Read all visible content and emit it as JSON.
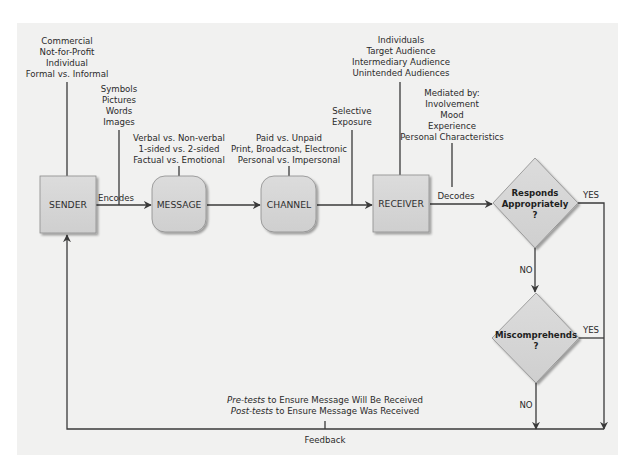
{
  "diagram": {
    "colors": {
      "panel": "#f1f1f0",
      "node_fill": "#d6d6d6",
      "line": "#3a3a3a",
      "text": "#2a2a2a"
    },
    "nodes": {
      "sender": "SENDER",
      "message": "MESSAGE",
      "channel": "CHANNEL",
      "receiver": "RECEIVER"
    },
    "decisions": {
      "responds": [
        "Responds",
        "Appropriately",
        "?"
      ],
      "miscomprehends": [
        "Miscomprehends",
        "?"
      ]
    },
    "annotations": {
      "sender_types": [
        "Commercial",
        "Not-for-Profit",
        "Individual",
        "Formal vs. Informal"
      ],
      "encoding_forms": [
        "Symbols",
        "Pictures",
        "Words",
        "Images"
      ],
      "message_types": [
        "Verbal vs. Non-verbal",
        "1-sided vs. 2-sided",
        "Factual vs. Emotional"
      ],
      "channel_types": [
        "Paid vs. Unpaid",
        "Print, Broadcast, Electronic",
        "Personal vs. Impersonal"
      ],
      "selective_exposure": [
        "Selective",
        "Exposure"
      ],
      "receiver_types": [
        "Individuals",
        "Target Audience",
        "Intermediary Audience",
        "Unintended Audiences"
      ],
      "mediators": [
        "Mediated by:",
        "Involvement",
        "Mood",
        "Experience",
        "Personal Characteristics"
      ]
    },
    "edge_labels": {
      "encodes": "Encodes",
      "decodes": "Decodes",
      "yes1": "YES",
      "no1": "NO",
      "yes2": "YES",
      "no2": "NO",
      "feedback": "Feedback"
    },
    "tests": {
      "pre_italic": "Pre-tests",
      "pre_rest": " to Ensure Message Will Be Received",
      "post_italic": "Post-tests",
      "post_rest": " to Ensure Message Was Received"
    }
  }
}
